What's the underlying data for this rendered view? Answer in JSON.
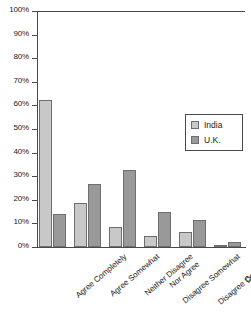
{
  "chart_data": {
    "type": "bar",
    "title": "",
    "xlabel": "",
    "ylabel": "",
    "ylim": [
      0,
      100
    ],
    "grid": false,
    "legend_position": "right",
    "categories": [
      "Agree Completely",
      "Agree Somewhat",
      "Neither Disagree Nor Agree",
      "Disagree Somewhat",
      "Disagree Completely",
      "Don't Know"
    ],
    "category_lines": [
      [
        "Agree Completely",
        ""
      ],
      [
        "Agree Somewhat",
        ""
      ],
      [
        "Neither Disagree",
        "Nor Agree"
      ],
      [
        "Disagree Somewhat",
        ""
      ],
      [
        "Disagree Completely",
        ""
      ],
      [
        "Don't Know",
        ""
      ]
    ],
    "series": [
      {
        "name": "India",
        "color": "#c8c8c8",
        "values": [
          62.5,
          18.5,
          8.5,
          4.5,
          6.5,
          0.5
        ]
      },
      {
        "name": "U.K.",
        "color": "#999999",
        "values": [
          14,
          26.5,
          32.5,
          15,
          11.5,
          2
        ]
      }
    ],
    "y_ticks": [
      "0%",
      "10%",
      "20%",
      "30%",
      "40%",
      "50%",
      "60%",
      "70%",
      "80%",
      "90%",
      "100%"
    ],
    "y_tick_values": [
      0,
      10,
      20,
      30,
      40,
      50,
      60,
      70,
      80,
      90,
      100
    ]
  },
  "legend": {
    "items": [
      {
        "label": "India",
        "swatch": "light-gray-swatch"
      },
      {
        "label": "U.K.",
        "swatch": "dark-gray-swatch"
      }
    ]
  },
  "colors": {
    "india": "#c8c8c8",
    "uk": "#999999",
    "axis": "#4a4a4a",
    "bar_outline": "#6e6e6e",
    "background": "#ffffff"
  }
}
